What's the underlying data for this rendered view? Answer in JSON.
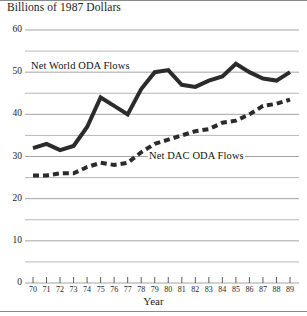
{
  "chart_data": {
    "type": "line",
    "title": "",
    "ylabel": "Billions of 1987 Dollars",
    "xlabel": "Year",
    "ylim": [
      0,
      60
    ],
    "xlim": [
      70,
      89
    ],
    "grid": true,
    "grid_minor_step": 5,
    "legend_position": "inline-annotations",
    "x": [
      70,
      71,
      72,
      73,
      74,
      75,
      76,
      77,
      78,
      79,
      80,
      81,
      82,
      83,
      84,
      85,
      86,
      87,
      88,
      89
    ],
    "xtick_labels": [
      "70",
      "71",
      "72",
      "73",
      "74",
      "75",
      "76",
      "77",
      "78",
      "79",
      "80",
      "81",
      "82",
      "83",
      "84",
      "85",
      "86",
      "87",
      "88",
      "89"
    ],
    "ytick_labels": [
      "0",
      "10",
      "20",
      "30",
      "40",
      "50",
      "60"
    ],
    "ytick_values": [
      0,
      10,
      20,
      30,
      40,
      50,
      60
    ],
    "series": [
      {
        "name": "Net World ODA Flows",
        "style": "solid",
        "color": "#2b2b2b",
        "width": 4,
        "values": [
          32.0,
          33.0,
          31.5,
          32.5,
          37.0,
          44.0,
          42.0,
          40.0,
          46.0,
          50.0,
          50.5,
          47.0,
          46.5,
          48.0,
          49.0,
          52.0,
          50.0,
          48.5,
          48.0,
          50.0
        ]
      },
      {
        "name": "Net DAC ODA Flows",
        "style": "dashed",
        "color": "#2b2b2b",
        "width": 4,
        "values": [
          25.5,
          25.5,
          26.0,
          26.0,
          27.5,
          28.5,
          28.0,
          28.5,
          31.0,
          33.0,
          34.0,
          35.0,
          36.0,
          36.5,
          38.0,
          38.5,
          40.0,
          42.0,
          42.5,
          43.5
        ]
      }
    ],
    "annotations": [
      {
        "text": "Net World ODA Flows",
        "series": "Net World ODA Flows"
      },
      {
        "text": "Net DAC ODA Flows",
        "series": "Net DAC ODA Flows"
      }
    ],
    "colors": {
      "line": "#2b2b2b",
      "grid": "#9a9a9a",
      "axis": "#4a4a4a",
      "text": "#1c1c1c",
      "background": "#ffffff"
    }
  }
}
